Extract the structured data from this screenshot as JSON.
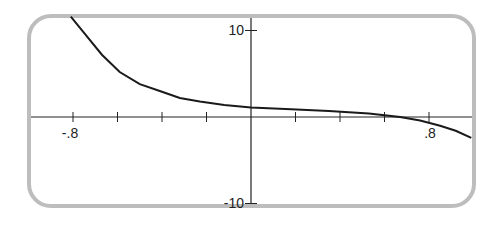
{
  "chart_data": {
    "type": "line",
    "title": "",
    "xlabel": "",
    "ylabel": "",
    "xlim": [
      -0.98,
      1.0
    ],
    "ylim": [
      -11,
      11
    ],
    "grid": false,
    "x_tick_step": 0.2,
    "y_tick_step": 5,
    "x_tick_labels": [
      {
        "value": -0.8,
        "label": "-.8"
      },
      {
        "value": 0.8,
        "label": ".8"
      }
    ],
    "y_tick_labels": [
      {
        "value": 10,
        "label": "10"
      },
      {
        "value": -10,
        "label": "-10"
      }
    ],
    "series": [
      {
        "name": "f(x)",
        "x": [
          -0.81,
          -0.74,
          -0.67,
          -0.59,
          -0.5,
          -0.41,
          -0.32,
          -0.23,
          -0.12,
          0.0,
          0.18,
          0.35,
          0.53,
          0.67,
          0.76,
          0.85,
          0.92,
          0.99
        ],
        "y": [
          5.8,
          4.7,
          3.6,
          2.6,
          1.9,
          1.5,
          1.1,
          0.9,
          0.7,
          0.55,
          0.45,
          0.35,
          0.2,
          0.0,
          -0.2,
          -0.5,
          -0.8,
          -1.2
        ]
      }
    ]
  }
}
